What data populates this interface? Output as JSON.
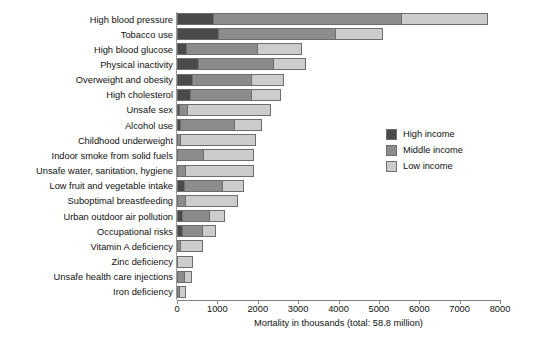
{
  "chart_data": {
    "type": "bar",
    "orientation": "horizontal",
    "stacked": true,
    "title": "",
    "subtitle": "",
    "xlabel": "Mortality in thousands (total: 58.8 million)",
    "ylabel": "",
    "xlim": [
      0,
      8000
    ],
    "xticks": [
      0,
      1000,
      2000,
      3000,
      4000,
      5000,
      6000,
      7000,
      8000
    ],
    "xtick_labels": [
      "0",
      "1000",
      "2000",
      "3000",
      "4000",
      "5000",
      "6000",
      "7000",
      "8000"
    ],
    "grid": false,
    "legend_position": "right",
    "legend": [
      "High income",
      "Middle income",
      "Low income"
    ],
    "series": [
      {
        "name": "High income",
        "color": "#4a4a4a",
        "values": [
          880,
          1000,
          200,
          500,
          350,
          300,
          20,
          60,
          0,
          0,
          0,
          170,
          0,
          110,
          110,
          0,
          0,
          0,
          0
        ]
      },
      {
        "name": "Middle income",
        "color": "#8c8c8c",
        "values": [
          4680,
          2950,
          1800,
          1900,
          1500,
          1550,
          180,
          1380,
          60,
          650,
          180,
          950,
          190,
          700,
          530,
          70,
          0,
          190,
          50
        ]
      },
      {
        "name": "Low income",
        "color": "#cccccc",
        "values": [
          2140,
          1150,
          1100,
          800,
          800,
          720,
          2130,
          660,
          1890,
          1260,
          1720,
          550,
          1310,
          390,
          330,
          570,
          400,
          170,
          170
        ]
      }
    ],
    "categories": [
      "High blood pressure",
      "Tobacco use",
      "High blood glucose",
      "Physical inactivity",
      "Overweight and obesity",
      "High cholesterol",
      "Unsafe sex",
      "Alcohol use",
      "Childhood underweight",
      "Indoor smoke from solid fuels",
      "Unsafe water, sanitation, hygiene",
      "Low fruit and vegetable intake",
      "Suboptimal breastfeeding",
      "Urban outdoor air pollution",
      "Occupational risks",
      "Vitamin A deficiency",
      "Zinc deficiency",
      "Unsafe health care injections",
      "Iron deficiency"
    ],
    "totals": [
      7700,
      5100,
      3100,
      3200,
      2650,
      2570,
      2330,
      2100,
      1950,
      1910,
      1900,
      1670,
      1500,
      1200,
      970,
      640,
      400,
      360,
      220
    ]
  },
  "colors": {
    "high_income": "#4a4a4a",
    "middle_income": "#8c8c8c",
    "low_income": "#cccccc",
    "axis": "#808080",
    "bar_outline": "#6d6d6d",
    "background": "#ffffff"
  }
}
